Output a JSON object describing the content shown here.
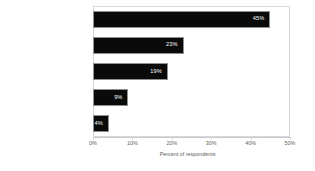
{
  "chart_data": {
    "type": "bar",
    "orientation": "horizontal",
    "title": "",
    "xlabel": "Percent of respondents",
    "ylabel": "",
    "categories": [
      "Face-to-face training",
      "On-the-job training",
      "Web-based or online training",
      "Self-paced training",
      "Other"
    ],
    "values": [
      45,
      23,
      19,
      9,
      4
    ],
    "value_labels": [
      "45%",
      "23%",
      "19%",
      "9%",
      "4%"
    ],
    "xlim": [
      0,
      50
    ],
    "xticks": [
      0,
      10,
      20,
      30,
      40,
      50
    ],
    "xtick_labels": [
      "0%",
      "10%",
      "20%",
      "30%",
      "40%",
      "50%"
    ],
    "grid": false,
    "legend": false,
    "bar_color": "#0a0a0a",
    "bar_edge_color": "#8f8f8f",
    "value_label_color": "#ffffff",
    "axis_text_color": "#5e5e5e",
    "frame_color": "#d8d8d8",
    "background_color": "#ffffff"
  }
}
